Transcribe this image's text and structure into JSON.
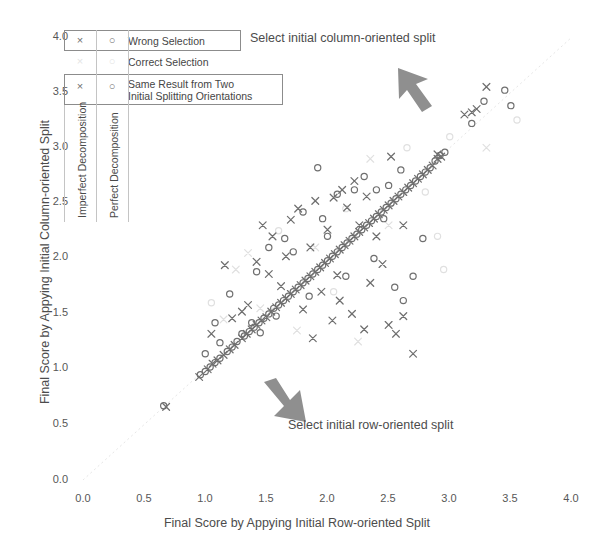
{
  "chart_data": {
    "type": "scatter",
    "title": "",
    "xlabel": "Final Score by Appying Initial Row-oriented Split",
    "ylabel": "Final Score by Appying Initial Column-oriented Split",
    "xlim": [
      0.0,
      4.0
    ],
    "ylim": [
      0.0,
      4.0
    ],
    "xticks": [
      "0.0",
      "0.5",
      "1.0",
      "1.5",
      "2.0",
      "2.5",
      "3.0",
      "3.5",
      "4.0"
    ],
    "yticks": [
      "0.0",
      "0.5",
      "1.0",
      "1.5",
      "2.0",
      "2.5",
      "3.0",
      "3.5",
      "4.0"
    ],
    "grid": false,
    "legend_position": "upper-left",
    "series": [
      {
        "name": "Wrong Selection / Imperfect Decomposition",
        "marker": "x",
        "color": "#6f6f6f",
        "points": [
          [
            0.68,
            0.66
          ],
          [
            0.95,
            0.93
          ],
          [
            1.02,
            1.0
          ],
          [
            1.06,
            1.05
          ],
          [
            1.1,
            1.08
          ],
          [
            1.15,
            1.13
          ],
          [
            1.2,
            1.18
          ],
          [
            1.24,
            1.22
          ],
          [
            1.3,
            1.28
          ],
          [
            1.34,
            1.32
          ],
          [
            1.38,
            1.36
          ],
          [
            1.42,
            1.4
          ],
          [
            1.46,
            1.44
          ],
          [
            1.5,
            1.47
          ],
          [
            1.54,
            1.52
          ],
          [
            1.58,
            1.56
          ],
          [
            1.62,
            1.6
          ],
          [
            1.66,
            1.64
          ],
          [
            1.7,
            1.68
          ],
          [
            1.74,
            1.72
          ],
          [
            1.78,
            1.76
          ],
          [
            1.82,
            1.8
          ],
          [
            1.86,
            1.84
          ],
          [
            1.9,
            1.88
          ],
          [
            1.94,
            1.92
          ],
          [
            1.98,
            1.96
          ],
          [
            2.02,
            2.0
          ],
          [
            2.06,
            2.04
          ],
          [
            2.1,
            2.08
          ],
          [
            2.14,
            2.12
          ],
          [
            2.18,
            2.16
          ],
          [
            2.22,
            2.2
          ],
          [
            2.26,
            2.24
          ],
          [
            2.3,
            2.28
          ],
          [
            2.34,
            2.32
          ],
          [
            2.38,
            2.36
          ],
          [
            2.42,
            2.4
          ],
          [
            2.46,
            2.44
          ],
          [
            2.5,
            2.48
          ],
          [
            2.54,
            2.52
          ],
          [
            2.58,
            2.56
          ],
          [
            2.62,
            2.6
          ],
          [
            2.66,
            2.64
          ],
          [
            2.7,
            2.68
          ],
          [
            2.74,
            2.72
          ],
          [
            2.78,
            2.76
          ],
          [
            2.82,
            2.8
          ],
          [
            2.86,
            2.84
          ],
          [
            2.9,
            2.9
          ],
          [
            2.93,
            2.92
          ],
          [
            1.16,
            1.94
          ],
          [
            1.42,
            1.97
          ],
          [
            1.47,
            2.3
          ],
          [
            1.55,
            2.2
          ],
          [
            1.62,
            1.75
          ],
          [
            1.7,
            2.35
          ],
          [
            1.76,
            2.45
          ],
          [
            1.8,
            1.54
          ],
          [
            1.86,
            2.1
          ],
          [
            1.9,
            2.52
          ],
          [
            1.95,
            1.7
          ],
          [
            2.0,
            2.26
          ],
          [
            2.04,
            1.44
          ],
          [
            2.1,
            1.62
          ],
          [
            2.16,
            2.46
          ],
          [
            2.2,
            1.5
          ],
          [
            2.26,
            2.3
          ],
          [
            2.3,
            1.36
          ],
          [
            2.35,
            1.78
          ],
          [
            2.4,
            2.2
          ],
          [
            2.45,
            1.95
          ],
          [
            2.5,
            1.4
          ],
          [
            2.56,
            1.32
          ],
          [
            2.62,
            1.48
          ],
          [
            2.7,
            1.14
          ],
          [
            1.3,
            1.52
          ],
          [
            1.35,
            1.58
          ],
          [
            1.22,
            1.46
          ],
          [
            1.05,
            1.32
          ],
          [
            2.05,
            2.55
          ],
          [
            2.12,
            2.62
          ],
          [
            2.22,
            2.7
          ],
          [
            2.32,
            2.56
          ],
          [
            2.52,
            2.92
          ],
          [
            2.62,
            2.3
          ],
          [
            3.22,
            3.35
          ],
          [
            3.3,
            3.55
          ],
          [
            3.12,
            3.3
          ],
          [
            3.18,
            3.32
          ],
          [
            2.9,
            2.94
          ],
          [
            1.88,
            1.28
          ],
          [
            2.08,
            1.85
          ],
          [
            1.66,
            2.02
          ],
          [
            1.52,
            1.86
          ]
        ]
      },
      {
        "name": "Wrong Selection / Perfect Decomposition",
        "marker": "o",
        "color": "#6f6f6f",
        "points": [
          [
            0.66,
            0.67
          ],
          [
            0.96,
            0.95
          ],
          [
            1.0,
            0.98
          ],
          [
            1.04,
            1.02
          ],
          [
            1.08,
            1.06
          ],
          [
            1.12,
            1.1
          ],
          [
            1.18,
            1.16
          ],
          [
            1.22,
            1.2
          ],
          [
            1.26,
            1.25
          ],
          [
            1.32,
            1.3
          ],
          [
            1.36,
            1.34
          ],
          [
            1.4,
            1.38
          ],
          [
            1.44,
            1.42
          ],
          [
            1.48,
            1.46
          ],
          [
            1.52,
            1.5
          ],
          [
            1.56,
            1.55
          ],
          [
            1.6,
            1.58
          ],
          [
            1.64,
            1.62
          ],
          [
            1.68,
            1.66
          ],
          [
            1.72,
            1.7
          ],
          [
            1.76,
            1.74
          ],
          [
            1.8,
            1.78
          ],
          [
            1.84,
            1.82
          ],
          [
            1.88,
            1.86
          ],
          [
            1.92,
            1.9
          ],
          [
            1.96,
            1.94
          ],
          [
            2.0,
            1.98
          ],
          [
            2.04,
            2.02
          ],
          [
            2.08,
            2.06
          ],
          [
            2.12,
            2.1
          ],
          [
            2.16,
            2.14
          ],
          [
            2.2,
            2.18
          ],
          [
            2.24,
            2.22
          ],
          [
            2.28,
            2.26
          ],
          [
            2.32,
            2.3
          ],
          [
            2.36,
            2.34
          ],
          [
            2.4,
            2.38
          ],
          [
            2.44,
            2.42
          ],
          [
            2.48,
            2.46
          ],
          [
            2.52,
            2.5
          ],
          [
            2.56,
            2.54
          ],
          [
            2.6,
            2.58
          ],
          [
            2.64,
            2.62
          ],
          [
            2.68,
            2.66
          ],
          [
            2.72,
            2.7
          ],
          [
            2.76,
            2.74
          ],
          [
            2.8,
            2.78
          ],
          [
            2.84,
            2.82
          ],
          [
            2.88,
            2.88
          ],
          [
            2.92,
            2.93
          ],
          [
            1.2,
            1.68
          ],
          [
            1.3,
            1.32
          ],
          [
            1.38,
            1.42
          ],
          [
            1.45,
            1.33
          ],
          [
            1.52,
            2.1
          ],
          [
            1.58,
            1.48
          ],
          [
            1.65,
            2.18
          ],
          [
            1.72,
            2.06
          ],
          [
            1.8,
            2.42
          ],
          [
            1.85,
            1.66
          ],
          [
            1.92,
            2.82
          ],
          [
            2.0,
            2.2
          ],
          [
            2.08,
            2.58
          ],
          [
            2.15,
            1.84
          ],
          [
            2.22,
            2.62
          ],
          [
            2.3,
            2.74
          ],
          [
            2.38,
            2.0
          ],
          [
            2.46,
            2.36
          ],
          [
            2.55,
            1.74
          ],
          [
            2.62,
            1.62
          ],
          [
            2.7,
            1.84
          ],
          [
            2.78,
            2.18
          ],
          [
            1.12,
            1.24
          ],
          [
            1.08,
            1.42
          ],
          [
            1.0,
            1.14
          ],
          [
            3.28,
            3.42
          ],
          [
            3.45,
            3.52
          ],
          [
            3.5,
            3.38
          ],
          [
            3.18,
            3.22
          ],
          [
            2.96,
            2.96
          ],
          [
            2.4,
            2.62
          ],
          [
            2.5,
            2.66
          ],
          [
            2.6,
            2.8
          ],
          [
            1.42,
            1.88
          ],
          [
            1.96,
            2.36
          ]
        ]
      },
      {
        "name": "Correct Selection",
        "marker": "x-o-faint",
        "color": "#e0e0e0",
        "points": [
          [
            1.25,
            1.9
          ],
          [
            1.6,
            2.25
          ],
          [
            1.9,
            2.1
          ],
          [
            2.15,
            2.45
          ],
          [
            2.5,
            2.3
          ],
          [
            2.8,
            2.6
          ],
          [
            1.45,
            1.55
          ],
          [
            2.05,
            1.7
          ],
          [
            2.35,
            2.9
          ],
          [
            3.0,
            3.1
          ],
          [
            1.75,
            1.35
          ],
          [
            2.9,
            2.2
          ],
          [
            1.35,
            2.05
          ],
          [
            2.65,
            3.0
          ],
          [
            3.3,
            3.0
          ],
          [
            1.05,
            1.6
          ],
          [
            2.25,
            1.25
          ],
          [
            3.55,
            3.25
          ],
          [
            1.15,
            1.45
          ],
          [
            2.95,
            1.9
          ]
        ]
      }
    ],
    "reference_line": {
      "description": "y = x diagonal",
      "from": [
        0.0,
        0.0
      ],
      "to": [
        4.0,
        4.0
      ]
    }
  },
  "axes": {
    "y_title": "Final Score by Appying Initial Column-oriented Split",
    "x_title": "Final Score by Appying Initial Row-oriented Split",
    "y_ticks": [
      "4.0",
      "3.5",
      "3.0",
      "2.5",
      "2.0",
      "1.5",
      "1.0",
      "0.5",
      "0.0"
    ],
    "x_ticks": [
      "0.0",
      "0.5",
      "1.0",
      "1.5",
      "2.0",
      "2.5",
      "3.0",
      "3.5",
      "4.0"
    ]
  },
  "legend": {
    "marker_x": "×",
    "marker_o": "○",
    "rows": [
      {
        "label": "Wrong Selection",
        "label2": "",
        "faint": false
      },
      {
        "label": "Correct Selection",
        "label2": "",
        "faint": true
      },
      {
        "label": "Same Result from Two",
        "label2": "Initial Splitting Orientations",
        "faint": false
      }
    ],
    "column_labels": [
      "Imperfect Decomposition",
      "Perfect Decomposition"
    ]
  },
  "annotations": [
    {
      "text": "Select initial column-oriented split",
      "arrow": "arrow-up-left"
    },
    {
      "text": "Select initial row-oriented split",
      "arrow": "arrow-down-right"
    }
  ]
}
